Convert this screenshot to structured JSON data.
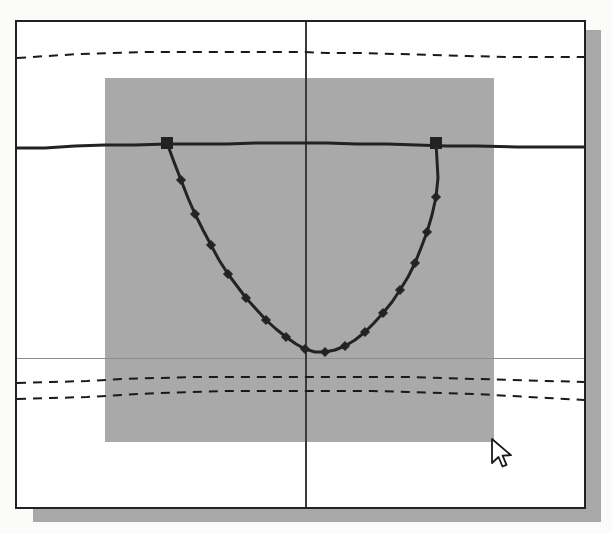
{
  "window": {
    "title": "",
    "frame": {
      "x": 15,
      "y": 20,
      "w": 571,
      "h": 489
    },
    "shadow_color": "#a8a8a8",
    "border_color": "#222222",
    "background": "#ffffff"
  },
  "cursor": {
    "name": "arrow-pointer",
    "x": 493,
    "y": 441,
    "fill": "#ffffff",
    "stroke": "#1a1a1a"
  },
  "chart_data": {
    "type": "line",
    "title": "",
    "subtitle": "",
    "xlabel": "",
    "ylabel": "",
    "grid": false,
    "legend_position": "none",
    "axis_style": "crosshair",
    "xlim": [
      0,
      567
    ],
    "ylim": [
      485,
      0
    ],
    "annotations": [
      {
        "name": "shaded-region",
        "type": "rect",
        "color": "#a9a9a9",
        "x": 88,
        "y": 56,
        "width": 389,
        "height": 364
      },
      {
        "name": "vertical-axis",
        "type": "vline",
        "x": 288,
        "color": "#3a3a3a",
        "width": 2
      },
      {
        "name": "horizontal-reference",
        "type": "hline",
        "y": 336,
        "color": "#8d8d8d",
        "width": 1
      }
    ],
    "series": [
      {
        "name": "upper-dashed-envelope",
        "style": "dashed",
        "marker": "none",
        "color": "#1a1a1a",
        "width": 2,
        "points": [
          [
            0,
            36
          ],
          [
            30,
            34
          ],
          [
            62,
            32
          ],
          [
            96,
            31
          ],
          [
            130,
            30
          ],
          [
            165,
            30
          ],
          [
            200,
            30
          ],
          [
            235,
            30
          ],
          [
            270,
            30
          ],
          [
            288,
            30
          ],
          [
            310,
            31
          ],
          [
            345,
            31
          ],
          [
            380,
            32
          ],
          [
            415,
            33
          ],
          [
            450,
            34
          ],
          [
            490,
            35
          ],
          [
            525,
            35
          ],
          [
            560,
            35
          ],
          [
            567,
            35
          ]
        ]
      },
      {
        "name": "baseline-solid",
        "style": "solid",
        "marker": "square-endpoints",
        "color": "#222222",
        "width": 3,
        "points": [
          [
            0,
            126
          ],
          [
            28,
            126
          ],
          [
            58,
            124
          ],
          [
            88,
            123
          ],
          [
            118,
            123
          ],
          [
            150,
            122
          ],
          [
            180,
            122
          ],
          [
            210,
            122
          ],
          [
            240,
            121
          ],
          [
            270,
            121
          ],
          [
            288,
            121
          ],
          [
            310,
            121
          ],
          [
            340,
            122
          ],
          [
            370,
            122
          ],
          [
            400,
            123
          ],
          [
            430,
            124
          ],
          [
            460,
            124
          ],
          [
            500,
            125
          ],
          [
            535,
            125
          ],
          [
            567,
            125
          ]
        ],
        "endpoint_markers": [
          {
            "x": 150,
            "y": 121,
            "shape": "square",
            "size": 11
          },
          {
            "x": 419,
            "y": 121,
            "shape": "square",
            "size": 11
          }
        ]
      },
      {
        "name": "parabola-curve",
        "style": "solid",
        "marker": "diamond",
        "color": "#232323",
        "width": 3,
        "marker_size": 9,
        "points": [
          [
            150,
            121
          ],
          [
            157,
            140
          ],
          [
            164,
            158
          ],
          [
            171,
            176
          ],
          [
            178,
            192
          ],
          [
            186,
            208
          ],
          [
            194,
            223
          ],
          [
            202,
            238
          ],
          [
            211,
            252
          ],
          [
            220,
            264
          ],
          [
            229,
            276
          ],
          [
            239,
            287
          ],
          [
            249,
            298
          ],
          [
            259,
            307
          ],
          [
            269,
            315
          ],
          [
            279,
            322
          ],
          [
            288,
            327
          ],
          [
            298,
            330
          ],
          [
            308,
            330
          ],
          [
            318,
            328
          ],
          [
            328,
            324
          ],
          [
            338,
            318
          ],
          [
            348,
            310
          ],
          [
            357,
            301
          ],
          [
            366,
            291
          ],
          [
            375,
            280
          ],
          [
            383,
            268
          ],
          [
            391,
            255
          ],
          [
            398,
            241
          ],
          [
            404,
            226
          ],
          [
            410,
            210
          ],
          [
            415,
            193
          ],
          [
            419,
            175
          ],
          [
            421,
            156
          ],
          [
            420,
            138
          ],
          [
            419,
            121
          ]
        ],
        "markers_at": [
          [
            150,
            121
          ],
          [
            164,
            158
          ],
          [
            178,
            192
          ],
          [
            194,
            223
          ],
          [
            211,
            252
          ],
          [
            229,
            276
          ],
          [
            249,
            298
          ],
          [
            269,
            315
          ],
          [
            288,
            327
          ],
          [
            308,
            330
          ],
          [
            328,
            324
          ],
          [
            348,
            310
          ],
          [
            366,
            291
          ],
          [
            383,
            268
          ],
          [
            398,
            241
          ],
          [
            410,
            210
          ],
          [
            419,
            175
          ],
          [
            419,
            121
          ]
        ]
      },
      {
        "name": "lower-dashed-envelope-1",
        "style": "dashed",
        "marker": "none",
        "color": "#1a1a1a",
        "width": 2,
        "points": [
          [
            0,
            361
          ],
          [
            35,
            360
          ],
          [
            70,
            359
          ],
          [
            105,
            357
          ],
          [
            140,
            356
          ],
          [
            175,
            355
          ],
          [
            210,
            355
          ],
          [
            245,
            355
          ],
          [
            280,
            355
          ],
          [
            288,
            355
          ],
          [
            320,
            355
          ],
          [
            355,
            355
          ],
          [
            390,
            355
          ],
          [
            425,
            356
          ],
          [
            460,
            357
          ],
          [
            495,
            358
          ],
          [
            530,
            359
          ],
          [
            567,
            360
          ]
        ]
      },
      {
        "name": "lower-dashed-envelope-2",
        "style": "dashed",
        "marker": "none",
        "color": "#1a1a1a",
        "width": 2,
        "points": [
          [
            0,
            377
          ],
          [
            35,
            376
          ],
          [
            70,
            375
          ],
          [
            105,
            373
          ],
          [
            140,
            371
          ],
          [
            175,
            370
          ],
          [
            210,
            369
          ],
          [
            245,
            369
          ],
          [
            280,
            369
          ],
          [
            288,
            369
          ],
          [
            320,
            369
          ],
          [
            355,
            369
          ],
          [
            390,
            370
          ],
          [
            425,
            371
          ],
          [
            460,
            372
          ],
          [
            495,
            374
          ],
          [
            530,
            376
          ],
          [
            567,
            378
          ]
        ]
      }
    ]
  }
}
